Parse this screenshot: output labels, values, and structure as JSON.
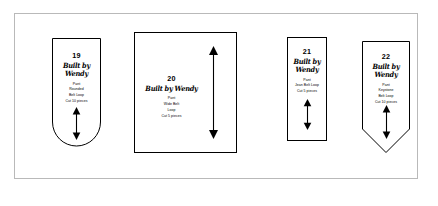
{
  "sheet": {
    "background_color": "#ffffff",
    "border_color": "#b9b9b9"
  },
  "brand": {
    "logo_text": "Built by Wendy"
  },
  "pieces": [
    {
      "number": "19",
      "logo": "Built by Wendy",
      "garment": "Pant",
      "name_line_1": "Rounded",
      "name_line_2": "Belt Loop",
      "cut": "Cut 10 pieces",
      "shape": "rounded-bottom",
      "grainline": "double-arrow-vertical"
    },
    {
      "number": "20",
      "logo": "Built by Wendy",
      "garment": "Pant",
      "name_line_1": "Wide Belt",
      "name_line_2": "Loop",
      "cut": "Cut 5 pieces",
      "shape": "rectangle",
      "grainline": "double-arrow-vertical"
    },
    {
      "number": "21",
      "logo": "Built by Wendy",
      "garment": "Pant",
      "name_line_1": "Jean Belt Loop",
      "name_line_2": "",
      "cut": "Cut 5 pieces",
      "shape": "rectangle",
      "grainline": "double-arrow-vertical"
    },
    {
      "number": "22",
      "logo": "Built by Wendy",
      "garment": "Pant",
      "name_line_1": "Keystone",
      "name_line_2": "Belt Loop",
      "cut": "Cut 10 pieces",
      "shape": "pointed-bottom",
      "grainline": "double-arrow-vertical"
    }
  ]
}
